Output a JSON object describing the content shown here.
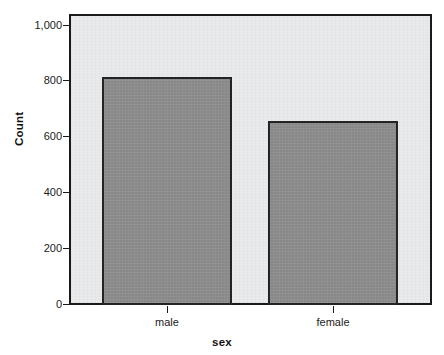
{
  "chart_data": {
    "type": "bar",
    "title": "",
    "subtitle": "",
    "categories": [
      "male",
      "female"
    ],
    "values": [
      815,
      655
    ],
    "series": [
      {
        "name": "Count",
        "values": [
          815,
          655
        ]
      }
    ],
    "xlabel": "sex",
    "ylabel": "Count",
    "ylim": [
      0,
      1060
    ],
    "yticks": [
      0,
      200,
      400,
      600,
      800,
      1000
    ],
    "ytick_labels": [
      "0",
      "200",
      "400",
      "600",
      "800",
      "1,000"
    ],
    "xtick_labels": [
      "male",
      "female"
    ],
    "grid": false,
    "legend": false,
    "legend_position": "none",
    "annotations": [],
    "colors": {
      "bar_fill": "#8d8d8d",
      "bar_border": "#242424",
      "panel_background": "#e9eaeb",
      "frame": "#1a1a1a",
      "text": "#1b1b1b",
      "figure_background": "#ffffff"
    }
  },
  "axes": {
    "y_title": "Count",
    "x_title": "sex",
    "y_ticks": [
      {
        "label": "1,000",
        "value": 1000
      },
      {
        "label": "800",
        "value": 800
      },
      {
        "label": "600",
        "value": 600
      },
      {
        "label": "400",
        "value": 400
      },
      {
        "label": "200",
        "value": 200
      },
      {
        "label": "0",
        "value": 0
      }
    ],
    "x_ticks": [
      {
        "label": "male"
      },
      {
        "label": "female"
      }
    ]
  },
  "bars": [
    {
      "label": "male",
      "value": 815
    },
    {
      "label": "female",
      "value": 655
    }
  ]
}
